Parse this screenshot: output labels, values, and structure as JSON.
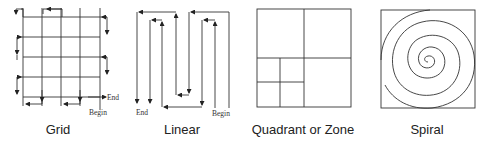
{
  "diagrams": [
    {
      "id": "grid",
      "caption": "Grid",
      "labels": {
        "begin": "Begin",
        "end": "End"
      }
    },
    {
      "id": "linear",
      "caption": "Linear",
      "labels": {
        "begin": "Begin",
        "end": "End"
      }
    },
    {
      "id": "quadrant",
      "caption": "Quadrant or Zone"
    },
    {
      "id": "spiral",
      "caption": "Spiral"
    }
  ],
  "colors": {
    "stroke": "#333333",
    "text": "#222222",
    "background": "#ffffff"
  }
}
